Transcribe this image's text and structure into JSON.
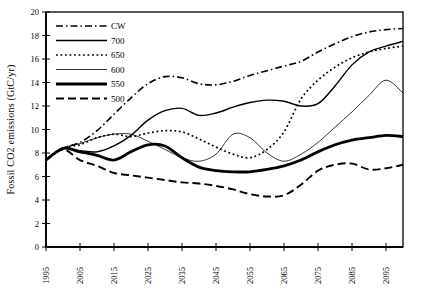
{
  "chart_data": {
    "type": "line",
    "title": "",
    "xlabel": "",
    "ylabel": "Fossil CO2 emissions (GtC/yr)",
    "xlim": [
      1995,
      2100
    ],
    "ylim": [
      0,
      20
    ],
    "xticks": [
      1995,
      2005,
      2015,
      2025,
      2035,
      2045,
      2055,
      2065,
      2075,
      2085,
      2095
    ],
    "yticks": [
      0,
      2,
      4,
      6,
      8,
      10,
      12,
      14,
      16,
      18,
      20
    ],
    "grid": false,
    "legend_position": "top-left-inside",
    "line_color": "#000000",
    "background": "#ffffff",
    "x": [
      1995,
      2000,
      2005,
      2010,
      2015,
      2020,
      2025,
      2030,
      2035,
      2040,
      2045,
      2050,
      2055,
      2060,
      2065,
      2070,
      2075,
      2080,
      2085,
      2090,
      2095,
      2100
    ],
    "series": [
      {
        "name": "CW",
        "style": "dash-dot",
        "values": [
          7.4,
          8.4,
          8.9,
          9.9,
          11.3,
          12.7,
          13.9,
          14.5,
          14.4,
          13.9,
          13.8,
          14.1,
          14.6,
          15.0,
          15.4,
          15.8,
          16.6,
          17.3,
          17.9,
          18.3,
          18.5,
          18.6
        ]
      },
      {
        "name": "700",
        "style": "solid",
        "values": [
          7.4,
          8.4,
          8.2,
          8.1,
          8.6,
          9.5,
          10.8,
          11.6,
          11.8,
          11.2,
          11.4,
          11.9,
          12.3,
          12.5,
          12.4,
          12.0,
          12.2,
          13.7,
          15.5,
          16.6,
          17.1,
          17.5
        ]
      },
      {
        "name": "650",
        "style": "dotted",
        "values": [
          7.4,
          8.4,
          8.7,
          9.3,
          9.6,
          9.4,
          9.7,
          9.9,
          9.8,
          9.2,
          8.5,
          7.9,
          7.6,
          8.3,
          9.8,
          12.6,
          14.2,
          15.3,
          16.1,
          16.6,
          16.9,
          17.1
        ]
      },
      {
        "name": "600",
        "style": "thin-solid",
        "values": [
          7.4,
          8.4,
          8.8,
          9.3,
          9.6,
          9.6,
          9.0,
          8.3,
          7.6,
          7.3,
          7.9,
          9.6,
          9.3,
          8.0,
          7.3,
          7.9,
          8.9,
          10.2,
          11.5,
          12.9,
          14.2,
          13.1
        ]
      },
      {
        "name": "550",
        "style": "thick-solid",
        "values": [
          7.4,
          8.4,
          8.1,
          7.8,
          7.4,
          8.1,
          8.7,
          8.6,
          7.6,
          6.8,
          6.5,
          6.4,
          6.4,
          6.6,
          6.9,
          7.4,
          8.1,
          8.7,
          9.1,
          9.3,
          9.5,
          9.4
        ]
      },
      {
        "name": "500",
        "style": "dashed",
        "values": [
          7.4,
          8.3,
          7.4,
          6.9,
          6.3,
          6.1,
          5.9,
          5.7,
          5.5,
          5.4,
          5.2,
          4.9,
          4.5,
          4.3,
          4.4,
          5.3,
          6.5,
          7.0,
          7.1,
          6.6,
          6.7,
          7.0
        ]
      }
    ]
  }
}
